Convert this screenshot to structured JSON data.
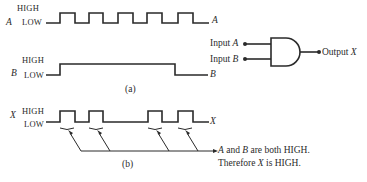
{
  "panel_a": {
    "caption": "(a)",
    "waveform_a": {
      "name": "A",
      "high_label": "HIGH",
      "low_label": "LOW",
      "end_label": "A"
    },
    "waveform_b": {
      "name": "B",
      "high_label": "HIGH",
      "low_label": "LOW",
      "end_label": "B"
    },
    "gate": {
      "type": "AND",
      "input_a_label": "Input A",
      "input_a_prefix": "Input ",
      "input_a_var": "A",
      "input_b_prefix": "Input ",
      "input_b_var": "B",
      "output_prefix": "Output ",
      "output_var": "X"
    }
  },
  "panel_b": {
    "caption": "(b)",
    "waveform_x": {
      "name": "X",
      "high_label": "HIGH",
      "low_label": "LOW",
      "end_label": "X"
    },
    "annotation": {
      "line1_prefix": "",
      "line1_var_a": "A",
      "line1_mid": " and ",
      "line1_var_b": "B",
      "line1_suffix": " are both HIGH.",
      "line2_prefix": "Therefore ",
      "line2_var": "X",
      "line2_suffix": " is HIGH."
    }
  },
  "waveforms": {
    "A": [
      0,
      1,
      0,
      1,
      0,
      1,
      0,
      1,
      0,
      1,
      0
    ],
    "B": [
      0,
      1,
      1,
      1,
      1,
      1,
      1,
      1,
      0,
      0,
      0
    ],
    "X": [
      0,
      1,
      0,
      1,
      0,
      0,
      0,
      1,
      0,
      1,
      0
    ]
  },
  "colors": {
    "ink": "#2a2a2a",
    "background": "#ffffff"
  }
}
